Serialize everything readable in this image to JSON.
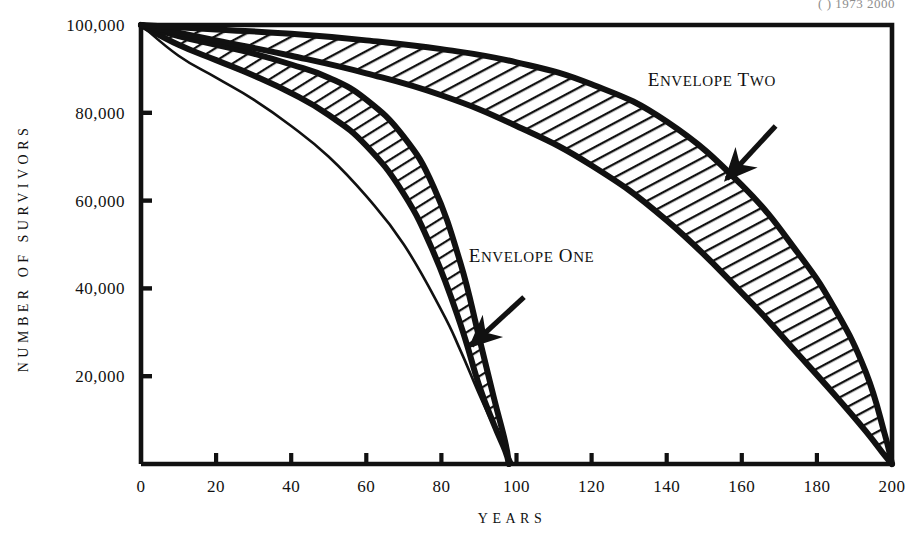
{
  "figure": {
    "caption_fragment": "(  )  1973  2000",
    "background": "#ffffff",
    "ink_color": "#111111"
  },
  "chart_data": {
    "type": "line",
    "title": "",
    "xlabel": "YEARS",
    "ylabel": "NUMBER OF SURVIVORS",
    "xlim": [
      0,
      200
    ],
    "ylim": [
      0,
      100000
    ],
    "grid": false,
    "legend_position": "inline-annotations",
    "xticks": [
      0,
      20,
      40,
      60,
      80,
      100,
      120,
      140,
      160,
      180,
      200
    ],
    "xtick_labels": [
      "0",
      "20",
      "40",
      "60",
      "80",
      "100",
      "120",
      "140",
      "160",
      "180",
      "200"
    ],
    "yticks": [
      20000,
      40000,
      60000,
      80000,
      100000
    ],
    "ytick_labels": [
      "20,000",
      "40,000",
      "60,000",
      "80,000",
      "100,000"
    ],
    "annotations": [
      {
        "text": "ENVELOPE TWO",
        "label_x": 152,
        "label_y": 86000,
        "arrow_from_x": 169,
        "arrow_from_y": 77000,
        "arrow_to_x": 156,
        "arrow_to_y": 65000
      },
      {
        "text": "ENVELOPE ONE",
        "label_x": 104,
        "label_y": 46000,
        "arrow_from_x": 102,
        "arrow_from_y": 38000,
        "arrow_to_x": 88,
        "arrow_to_y": 27000
      }
    ],
    "series": [
      {
        "name": "present survival curve",
        "style": "thin-line",
        "x": [
          0,
          10,
          20,
          30,
          40,
          50,
          60,
          70,
          80,
          85,
          90,
          94,
          97,
          99
        ],
        "values": [
          100000,
          93000,
          88000,
          83000,
          77000,
          70000,
          61000,
          50000,
          35000,
          26000,
          16000,
          8500,
          3500,
          0
        ]
      },
      {
        "name": "envelope one lower bound",
        "style": "thick-line",
        "x": [
          0,
          10,
          20,
          30,
          40,
          50,
          60,
          70,
          78,
          85,
          90,
          94,
          97,
          98
        ],
        "values": [
          100000,
          95500,
          92000,
          88500,
          84500,
          79500,
          72500,
          61500,
          48000,
          32000,
          18000,
          9000,
          3000,
          0
        ]
      },
      {
        "name": "envelope one upper bound",
        "style": "thick-line",
        "x": [
          0,
          10,
          20,
          30,
          40,
          50,
          60,
          70,
          78,
          85,
          90,
          94,
          97,
          98
        ],
        "values": [
          100000,
          97500,
          95500,
          93500,
          91000,
          88000,
          83000,
          74500,
          63000,
          46000,
          29000,
          15000,
          5000,
          0
        ]
      },
      {
        "name": "envelope two lower bound",
        "style": "thick-line",
        "x": [
          0,
          20,
          40,
          60,
          80,
          100,
          120,
          140,
          160,
          175,
          185,
          193,
          198,
          200
        ],
        "values": [
          100000,
          96500,
          93000,
          89000,
          84000,
          77000,
          68000,
          55500,
          39000,
          25000,
          15500,
          7500,
          2000,
          0
        ]
      },
      {
        "name": "envelope two upper bound",
        "style": "thick-line",
        "x": [
          0,
          20,
          40,
          60,
          80,
          100,
          120,
          140,
          160,
          175,
          185,
          193,
          198,
          200
        ],
        "values": [
          100000,
          99000,
          98000,
          96500,
          94500,
          91500,
          86500,
          78000,
          63500,
          48000,
          35000,
          21000,
          7000,
          0
        ]
      }
    ],
    "bands": [
      {
        "name": "Envelope One",
        "hatched": true,
        "lower": "envelope one lower bound",
        "upper": "envelope one upper bound"
      },
      {
        "name": "Envelope Two",
        "hatched": true,
        "lower": "envelope two lower bound",
        "upper": "envelope two upper bound"
      }
    ]
  }
}
